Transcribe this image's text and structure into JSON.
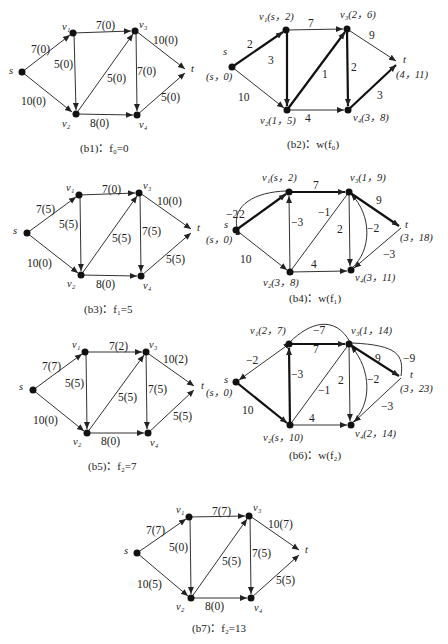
{
  "diagrams": [
    {
      "id": "b1",
      "caption": "(b1)：f₀=0",
      "nodes": {
        "s": "s",
        "v1": "v₁",
        "v2": "v₂",
        "v3": "v₃",
        "v4": "v₄",
        "t": "t"
      },
      "edges": {
        "s_v1": "7(0)",
        "s_v2": "10(0)",
        "v1_v3": "7(0)",
        "v1_v2": "5(0)",
        "v2_v3": "5(0)",
        "v3_v4": "7(0)",
        "v2_v4": "8(0)",
        "v3_t": "10(0)",
        "v4_t": "5(0)"
      }
    },
    {
      "id": "b2",
      "caption": "(b2)：w(f₀)",
      "nodes": {
        "s": "s",
        "s_label": "(s，0)",
        "v1": "v₁(s，2)",
        "v2": "v₂(1，5)",
        "v3": "v₃(2，6)",
        "v4": "v₄(3，8)",
        "t": "t",
        "t_label": "(4，11)"
      },
      "edges": {
        "s_v1": "2",
        "s_v2": "10",
        "v1_v3": "7",
        "v1_v2": "3",
        "v2_v3": "1",
        "v3_v4": "2",
        "v2_v4": "4",
        "v3_t": "9",
        "v4_t": "3"
      }
    },
    {
      "id": "b3",
      "caption": "(b3)：f₁=5",
      "nodes": {
        "s": "s",
        "v1": "v₁",
        "v2": "v₂",
        "v3": "v₃",
        "v4": "v₄",
        "t": "t"
      },
      "edges": {
        "s_v1": "7(5)",
        "s_v2": "10(0)",
        "v1_v3": "7(0)",
        "v1_v2": "5(5)",
        "v2_v3": "5(5)",
        "v3_v4": "7(5)",
        "v2_v4": "8(0)",
        "v3_t": "10(0)",
        "v4_t": "5(5)"
      }
    },
    {
      "id": "b4",
      "caption": "(b4)：w(f₁)",
      "nodes": {
        "s": "s",
        "s_label": "(s，0)",
        "v1": "v₁(s，2)",
        "v2": "v₂(3，8)",
        "v3": "v₃(1，9)",
        "v4": "v₄(3，11)",
        "t": "t",
        "t_label": "(3，18)"
      },
      "edges": {
        "s_v1": "2",
        "v1_s": "−2",
        "s_v2": "10",
        "v1_v3": "7",
        "v2_v1": "−3",
        "v3_v2": "−1",
        "v3_v4": "2",
        "v4_v3": "−2",
        "v2_v4": "4",
        "v3_t": "9",
        "t_v4": "−3"
      }
    },
    {
      "id": "b5",
      "caption": "(b5)：f₂=7",
      "nodes": {
        "s": "s",
        "v1": "v₁",
        "v2": "v₂",
        "v3": "v₃",
        "v4": "v₄",
        "t": "t"
      },
      "edges": {
        "s_v1": "7(7)",
        "s_v2": "10(0)",
        "v1_v3": "7(2)",
        "v1_v2": "5(5)",
        "v2_v3": "5(5)",
        "v3_v4": "7(5)",
        "v2_v4": "8(0)",
        "v3_t": "10(2)",
        "v4_t": "5(5)"
      }
    },
    {
      "id": "b6",
      "caption": "(b6)：w(f₂)",
      "nodes": {
        "s": "s",
        "s_label": "(s，0)",
        "v1": "v₁(2，7)",
        "v2": "v₂(s，10)",
        "v3": "v₃(1，14)",
        "v4": "v₄(2，14)",
        "t": "t",
        "t_label": "(3，23)"
      },
      "edges": {
        "v1_s": "−2",
        "v3_v1": "−7",
        "s_v2": "10",
        "v1_v3": "7",
        "v2_v1": "−3",
        "v3_v2": "−1",
        "v3_v4": "2",
        "v4_v3": "−2",
        "v2_v4": "4",
        "v3_t": "9",
        "t_v3": "−9",
        "t_v4": "−3"
      }
    },
    {
      "id": "b7",
      "caption": "(b7)：f₂=13",
      "nodes": {
        "s": "s",
        "v1": "v₁",
        "v2": "v₂",
        "v3": "v₃",
        "v4": "v₄",
        "t": "t"
      },
      "edges": {
        "s_v1": "7(7)",
        "s_v2": "10(5)",
        "v1_v3": "7(7)",
        "v1_v2": "5(0)",
        "v2_v3": "5(5)",
        "v3_v4": "7(5)",
        "v2_v4": "8(0)",
        "v3_t": "10(7)",
        "v4_t": "5(5)"
      }
    }
  ]
}
